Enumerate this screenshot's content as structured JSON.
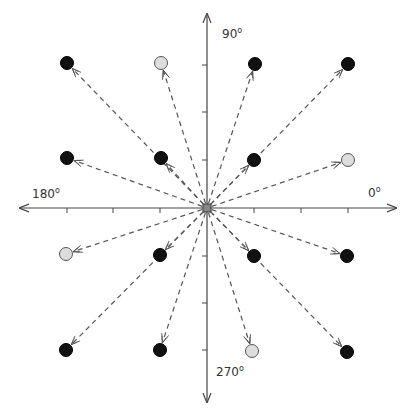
{
  "diagram": {
    "origin": {
      "x": 207,
      "y": 208
    },
    "axes": {
      "x_min": 20,
      "x_max": 396,
      "y_min": 14,
      "y_max": 402,
      "labels": [
        {
          "text": "0",
          "unit": "o",
          "x": 368,
          "y": 185
        },
        {
          "text": "90",
          "unit": "o",
          "x": 222,
          "y": 26
        },
        {
          "text": "180",
          "unit": "o",
          "x": 32,
          "y": 186
        },
        {
          "text": "270",
          "unit": "o",
          "x": 216,
          "y": 364
        }
      ],
      "x_ticks": [
        67,
        113,
        160,
        254,
        301,
        348
      ],
      "y_ticks": [
        65,
        112,
        160,
        256,
        303,
        350
      ]
    },
    "colors": {
      "axis": "#444444",
      "arrow": "#555555",
      "filled_point": "#111111",
      "hollow_point": "#dddddd",
      "hollow_stroke": "#555555"
    },
    "points": [
      {
        "x": 67,
        "y": 63,
        "fill": "black"
      },
      {
        "x": 161,
        "y": 63,
        "fill": "gray"
      },
      {
        "x": 255,
        "y": 64,
        "fill": "black"
      },
      {
        "x": 348,
        "y": 64,
        "fill": "black"
      },
      {
        "x": 67,
        "y": 158,
        "fill": "black"
      },
      {
        "x": 161,
        "y": 158,
        "fill": "black"
      },
      {
        "x": 254,
        "y": 160,
        "fill": "black"
      },
      {
        "x": 348,
        "y": 160,
        "fill": "gray"
      },
      {
        "x": 66,
        "y": 254,
        "fill": "gray"
      },
      {
        "x": 160,
        "y": 255,
        "fill": "black"
      },
      {
        "x": 254,
        "y": 256,
        "fill": "black"
      },
      {
        "x": 347,
        "y": 256,
        "fill": "black"
      },
      {
        "x": 66,
        "y": 350,
        "fill": "black"
      },
      {
        "x": 160,
        "y": 350,
        "fill": "black"
      },
      {
        "x": 252,
        "y": 351,
        "fill": "gray"
      },
      {
        "x": 347,
        "y": 352,
        "fill": "black"
      }
    ]
  }
}
